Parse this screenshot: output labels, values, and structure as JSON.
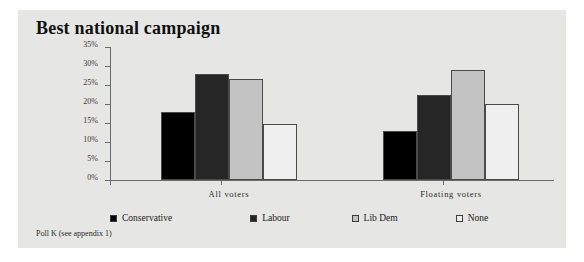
{
  "figure": {
    "title": "Best national campaign",
    "footnote": "Poll K (see appendix 1)",
    "background_color": "#e6e6e4",
    "page_background_color": "#ffffff"
  },
  "legend": {
    "position": "bottom",
    "entries": [
      {
        "label": "Conservative",
        "color": "#000000"
      },
      {
        "label": "Labour",
        "color": "#262626"
      },
      {
        "label": "Lib Dem",
        "color": "#c3c3c3"
      },
      {
        "label": "None",
        "color": "#efefef"
      }
    ]
  },
  "axes": {
    "y_ticks": [
      "0%",
      "5%",
      "10%",
      "15%",
      "20%",
      "25%",
      "30%",
      "35%"
    ],
    "x_labels": [
      "All voters",
      "Floating voters"
    ]
  },
  "chart_data": {
    "type": "bar",
    "title": "Best national campaign",
    "xlabel": "",
    "ylabel": "",
    "ylim": [
      0,
      35
    ],
    "ytick_values": [
      0,
      5,
      10,
      15,
      20,
      25,
      30,
      35
    ],
    "ytick_labels": [
      "0%",
      "5%",
      "10%",
      "15%",
      "20%",
      "25%",
      "30%",
      "35%"
    ],
    "grid": false,
    "legend_position": "bottom",
    "categories": [
      "All voters",
      "Floating voters"
    ],
    "series": [
      {
        "name": "Conservative",
        "color": "#000000",
        "values": [
          18,
          13
        ]
      },
      {
        "name": "Labour",
        "color": "#262626",
        "values": [
          28,
          22.5
        ]
      },
      {
        "name": "Lib Dem",
        "color": "#c3c3c3",
        "values": [
          26.5,
          29
        ]
      },
      {
        "name": "None",
        "color": "#efefef",
        "values": [
          14.8,
          20
        ]
      }
    ],
    "annotations": [
      "Poll K (see appendix 1)"
    ]
  }
}
